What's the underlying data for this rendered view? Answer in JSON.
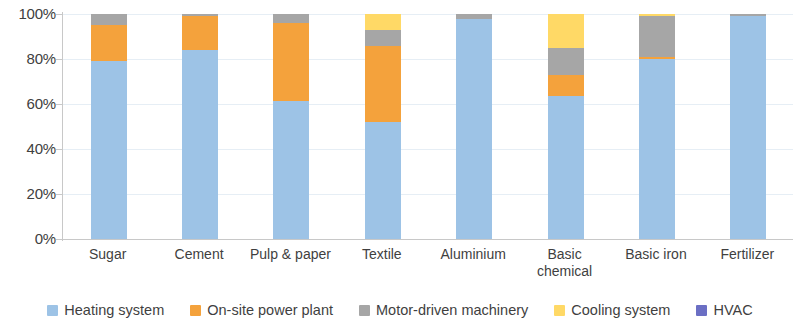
{
  "chart_data": {
    "type": "bar",
    "stacked": true,
    "stack_mode": "percent",
    "title": "",
    "subtitle": "",
    "xlabel": "",
    "ylabel": "",
    "ylim": [
      0,
      100
    ],
    "ytick_labels": [
      "100%",
      "80%",
      "60%",
      "40%",
      "20%",
      "0%"
    ],
    "ytick_values": [
      100,
      80,
      60,
      40,
      20,
      0
    ],
    "grid": true,
    "grid_axis": "y",
    "legend_position": "bottom",
    "categories": [
      "Sugar",
      "Cement",
      "Pulp & paper",
      "Textile",
      "Aluminium",
      "Basic chemical",
      "Basic iron",
      "Fertilizer"
    ],
    "series": [
      {
        "name": "Heating system",
        "color": "#9dc3e6",
        "values": [
          79,
          84,
          61.5,
          52,
          98,
          63.5,
          80,
          99
        ]
      },
      {
        "name": "On-site power plant",
        "color": "#f4a23c",
        "values": [
          16,
          15,
          34.5,
          34,
          0,
          9.5,
          1,
          0
        ]
      },
      {
        "name": "Motor-driven machinery",
        "color": "#a6a6a6",
        "values": [
          5,
          1,
          4,
          7,
          2,
          12,
          18,
          1
        ]
      },
      {
        "name": "Cooling system",
        "color": "#ffd966",
        "values": [
          0,
          0,
          0,
          7,
          0,
          15,
          1,
          0
        ]
      },
      {
        "name": "HVAC",
        "color": "#6b6fc4",
        "values": [
          0,
          0,
          0,
          0,
          0,
          0,
          0,
          0
        ]
      }
    ]
  },
  "legend": {
    "items": [
      {
        "label": "Heating system",
        "color": "#9dc3e6"
      },
      {
        "label": "On-site power plant",
        "color": "#f4a23c"
      },
      {
        "label": "Motor-driven machinery",
        "color": "#a6a6a6"
      },
      {
        "label": "Cooling system",
        "color": "#ffd966"
      },
      {
        "label": "HVAC",
        "color": "#6b6fc4"
      }
    ]
  }
}
